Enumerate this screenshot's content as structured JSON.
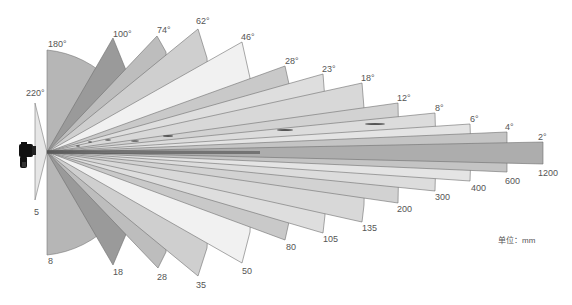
{
  "unit_label": "单位：mm",
  "origin": [
    47,
    152
  ],
  "wedges": [
    {
      "angle": "220°",
      "focal": "5",
      "fill": "#e6e6e6",
      "top": [
        35,
        103
      ],
      "bottom": [
        35,
        200
      ],
      "angle_pos": [
        29,
        92
      ],
      "focal_pos": [
        33,
        207
      ]
    },
    {
      "angle": "180°",
      "focal": "8",
      "fill": "#b4b4b4",
      "top": [
        47,
        50
      ],
      "bottom": [
        47,
        255
      ],
      "angle_pos": [
        47,
        42
      ],
      "focal_pos": [
        48,
        259
      ]
    },
    {
      "angle": "100°",
      "focal": "18",
      "fill": "#9a9a9a",
      "top": [
        113,
        38
      ],
      "bottom": [
        113,
        265
      ],
      "outer_top": [
        130,
        80
      ],
      "outer_bottom": [
        130,
        225
      ],
      "angle_pos": [
        113,
        30
      ],
      "focal_pos": [
        113,
        268
      ]
    },
    {
      "angle": "74°",
      "focal": "28",
      "fill": "#bdbdbd",
      "top": [
        157,
        36
      ],
      "bottom": [
        158,
        268
      ],
      "outer_top": [
        166,
        52
      ],
      "outer_bottom": [
        166,
        252
      ],
      "angle_pos": [
        157,
        28
      ],
      "focal_pos": [
        157,
        276
      ]
    },
    {
      "angle": "62°",
      "focal": "35",
      "fill": "#cfcfcf",
      "top": [
        198,
        29
      ],
      "bottom": [
        198,
        276
      ],
      "outer_top": [
        207,
        58
      ],
      "outer_bottom": [
        207,
        248
      ],
      "angle_pos": [
        196,
        18
      ],
      "focal_pos": [
        196,
        282
      ]
    },
    {
      "angle": "46°",
      "focal": "50",
      "fill": "#efefef",
      "top": [
        242,
        42
      ],
      "bottom": [
        242,
        263
      ],
      "outer_top": [
        250,
        78
      ],
      "outer_bottom": [
        250,
        232
      ],
      "angle_pos": [
        241,
        34
      ],
      "focal_pos": [
        242,
        268
      ]
    },
    {
      "angle": "28°",
      "focal": "80",
      "fill": "#cacaca",
      "top": [
        285,
        66
      ],
      "bottom": [
        285,
        240
      ],
      "outer_top": [
        289,
        84
      ],
      "outer_bottom": [
        289,
        222
      ],
      "angle_pos": [
        285,
        58
      ],
      "focal_pos": [
        285,
        244
      ]
    },
    {
      "angle": "23°",
      "focal": "105",
      "fill": "#dedede",
      "top": [
        323,
        74
      ],
      "bottom": [
        323,
        233
      ],
      "outer_top": [
        324,
        84
      ],
      "outer_bottom": [
        324,
        222
      ],
      "angle_pos": [
        322,
        66
      ],
      "focal_pos": [
        322,
        235
      ]
    },
    {
      "angle": "18°",
      "focal": "135",
      "fill": "#d9d9d9",
      "top": [
        362,
        83
      ],
      "bottom": [
        362,
        222
      ],
      "outer_top": [
        363,
        108
      ],
      "outer_bottom": [
        363,
        220
      ],
      "angle_pos": [
        361,
        75
      ],
      "focal_pos": [
        362,
        224
      ]
    },
    {
      "angle": "12°",
      "focal": "200",
      "fill": "#d2d2d2",
      "top": [
        398,
        103
      ],
      "bottom": [
        398,
        203
      ],
      "outer_top": [
        398,
        108
      ],
      "outer_bottom": [
        398,
        200
      ],
      "angle_pos": [
        398,
        95
      ],
      "focal_pos": [
        397,
        206
      ]
    },
    {
      "angle": "8°",
      "focal": "300",
      "fill": "#dcdcdc",
      "top": [
        435,
        113
      ],
      "bottom": [
        435,
        191
      ],
      "outer_top": [
        435,
        117
      ],
      "outer_bottom": [
        435,
        189
      ],
      "angle_pos": [
        435,
        105
      ],
      "focal_pos": [
        435,
        193
      ]
    },
    {
      "angle": "6°",
      "focal": "400",
      "fill": "#e3e3e3",
      "top": [
        470,
        124
      ],
      "bottom": [
        470,
        181
      ],
      "outer_top": [
        470,
        126
      ],
      "outer_bottom": [
        470,
        179
      ],
      "angle_pos": [
        470,
        116
      ],
      "focal_pos": [
        471,
        184
      ]
    },
    {
      "angle": "4°",
      "focal": "600",
      "fill": "#c6c6c6",
      "top": [
        507,
        132
      ],
      "bottom": [
        507,
        172
      ],
      "outer_top": [
        507,
        133
      ],
      "outer_bottom": [
        507,
        171
      ],
      "angle_pos": [
        505,
        124
      ],
      "focal_pos": [
        505,
        176
      ]
    },
    {
      "angle": "2°",
      "focal": "1200",
      "fill": "#adadad",
      "top": [
        543,
        142
      ],
      "bottom": [
        543,
        164
      ],
      "outer_top": [
        543,
        142
      ],
      "outer_bottom": [
        543,
        164
      ],
      "angle_pos": [
        538,
        134
      ],
      "focal_pos": [
        538,
        169
      ]
    }
  ],
  "labels": {
    "angles": [
      "220°",
      "180°",
      "100°",
      "74°",
      "62°",
      "46°",
      "28°",
      "23°",
      "18°",
      "12°",
      "8°",
      "6°",
      "4°",
      "2°"
    ],
    "focals": [
      "5",
      "8",
      "18",
      "28",
      "35",
      "50",
      "80",
      "105",
      "135",
      "200",
      "300",
      "400",
      "600",
      "1200"
    ]
  },
  "colors": {
    "stroke": "#6e6e6e",
    "text": "#555555",
    "camera": "#111111"
  }
}
